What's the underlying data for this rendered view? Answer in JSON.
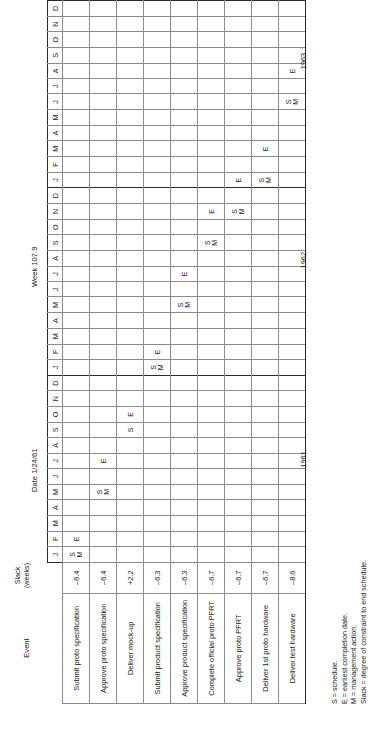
{
  "document": {
    "headers": {
      "event_caption": "Event",
      "slack_caption_line1": "Slack",
      "slack_caption_line2": "(weeks)",
      "date_label": "Date 1/24/61",
      "week_label": "Week 107.9"
    },
    "months": [
      "J",
      "F",
      "M",
      "A",
      "M",
      "J",
      "J",
      "A",
      "S",
      "O",
      "N",
      "D"
    ],
    "years": [
      "1961",
      "1962",
      "1963"
    ],
    "rows": [
      {
        "event": "Submit proto specification",
        "slack": "–6.4",
        "marks": {
          "0": "S\nM",
          "1": "E"
        }
      },
      {
        "event": "Approve proto specification",
        "slack": "–6.4",
        "marks": {
          "4": "S\nM",
          "6": "E"
        }
      },
      {
        "event": "Deliver mock-up",
        "slack": "+2.2",
        "marks": {
          "8": "S",
          "9": "E"
        }
      },
      {
        "event": "Submit product specification",
        "slack": "–6.3",
        "marks": {
          "12": "S\nM",
          "13": "E"
        }
      },
      {
        "event": "Approve product specification",
        "slack": "–6.3",
        "marks": {
          "16": "S\nM",
          "18": "E"
        }
      },
      {
        "event": "Complete official proto PFRT",
        "slack": "–6.7",
        "marks": {
          "20": "S\nM",
          "22": "E"
        }
      },
      {
        "event": "Approve proto PFRT",
        "slack": "–6.7",
        "marks": {
          "22": "S\nM",
          "24": "E"
        }
      },
      {
        "event": "Deliver 1st proto hardware",
        "slack": "–6.7",
        "marks": {
          "24": "S\nM",
          "26": "E"
        }
      },
      {
        "event": "Deliver test hardware",
        "slack": "–8.6",
        "marks": {
          "29": "S\nM",
          "31": "E"
        }
      }
    ],
    "legend": [
      "S = schedule.",
      "E = earliest completion date.",
      "M = management action.",
      "Slack = degree of constraint to end schedule."
    ],
    "colors": {
      "ink": "#1a1a1a",
      "rule": "#8b8b8b",
      "heavy_rule": "#2b2b2b",
      "paper": "#ffffff"
    }
  }
}
